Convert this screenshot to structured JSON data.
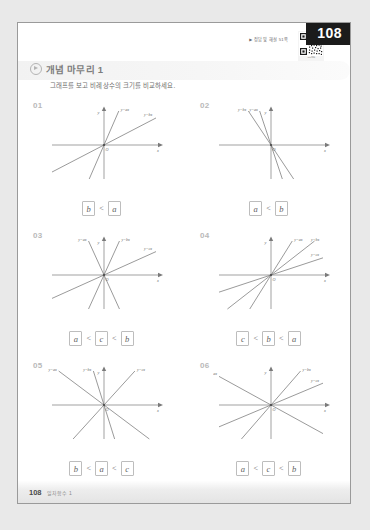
{
  "page": {
    "number_badge": "108",
    "footer_number": "108",
    "footer_text": "일차함수 1",
    "answer_ref": "정답 및 해설 51쪽",
    "answer_ref_marker": "▶",
    "qr_caption": "QR코드"
  },
  "section": {
    "title": "개념 마무리 1",
    "icon": "play-circle-icon",
    "description": "그래프를 보고 비례상수의 크기를 비교하세요."
  },
  "axis_labels": {
    "x": "x",
    "y": "y",
    "origin": "O"
  },
  "problems": [
    {
      "number": "01",
      "lines": [
        {
          "label": "y=ax",
          "slope": 2.3,
          "label_side": "right"
        },
        {
          "label": "y=bx",
          "slope": 0.52,
          "label_side": "right"
        }
      ],
      "answer": {
        "terms": [
          "b",
          "a"
        ],
        "signs": [
          "<"
        ]
      }
    },
    {
      "number": "02",
      "lines": [
        {
          "label": "y=ax",
          "slope": -3.0,
          "label_side": "left"
        },
        {
          "label": "y=bx",
          "slope": -1.5,
          "label_side": "left"
        }
      ],
      "answer": {
        "terms": [
          "a",
          "b"
        ],
        "signs": [
          "<"
        ]
      }
    },
    {
      "number": "03",
      "lines": [
        {
          "label": "y=ax",
          "slope": -2.2,
          "label_side": "left"
        },
        {
          "label": "y=bx",
          "slope": 2.2,
          "label_side": "right"
        },
        {
          "label": "y=cx",
          "slope": 0.45,
          "label_side": "right"
        }
      ],
      "answer": {
        "terms": [
          "a",
          "c",
          "b"
        ],
        "signs": [
          "<",
          "<"
        ]
      }
    },
    {
      "number": "04",
      "lines": [
        {
          "label": "y=ax",
          "slope": 1.6,
          "label_side": "right"
        },
        {
          "label": "y=bx",
          "slope": 0.78,
          "label_side": "right"
        },
        {
          "label": "y=cx",
          "slope": 0.33,
          "label_side": "right"
        }
      ],
      "answer": {
        "terms": [
          "c",
          "b",
          "a"
        ],
        "signs": [
          "<",
          "<"
        ]
      }
    },
    {
      "number": "05",
      "lines": [
        {
          "label": "y=bx",
          "slope": -3.2,
          "label_side": "left"
        },
        {
          "label": "y=ax",
          "slope": -0.75,
          "label_side": "left"
        },
        {
          "label": "y=cx",
          "slope": 1.1,
          "label_side": "right"
        }
      ],
      "answer": {
        "terms": [
          "b",
          "a",
          "c"
        ],
        "signs": [
          "<",
          "<"
        ]
      }
    },
    {
      "number": "06",
      "lines": [
        {
          "label": "y=ax",
          "slope": -0.55,
          "label_side": "left"
        },
        {
          "label": "y=bx",
          "slope": 1.15,
          "label_side": "right"
        },
        {
          "label": "y=cx",
          "slope": 0.42,
          "label_side": "right"
        }
      ],
      "answer": {
        "terms": [
          "a",
          "c",
          "b"
        ],
        "signs": [
          "<",
          "<"
        ]
      }
    }
  ],
  "colors": {
    "badge_bg": "#1b1b1b",
    "badge_text": "#ffffff",
    "page_bg": "#ffffff",
    "outer_bg": "#e9e9e9",
    "axis": "#7a7a7a",
    "line": "#6e6e6e",
    "title_text": "#7d7d7d"
  }
}
